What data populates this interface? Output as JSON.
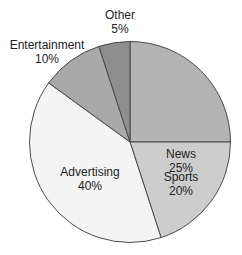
{
  "chart_data": {
    "type": "pie",
    "title": "",
    "categories": [
      "News",
      "Sports",
      "Advertising",
      "Entertainment",
      "Other"
    ],
    "values": [
      25,
      20,
      40,
      10,
      5
    ],
    "labels": [
      "News\n25%",
      "Sports\n20%",
      "Advertising\n40%",
      "Entertainment\n10%",
      "Other\n5%"
    ],
    "colors": [
      "#b4b4b4",
      "#cdcdcd",
      "#f4f4f4",
      "#a9a9a9",
      "#8e8e8e"
    ],
    "start_angle_deg": 0,
    "direction": "clockwise",
    "legend": "none"
  },
  "slices": [
    {
      "name": "News",
      "pct": "25%"
    },
    {
      "name": "Sports",
      "pct": "20%"
    },
    {
      "name": "Advertising",
      "pct": "40%"
    },
    {
      "name": "Entertainment",
      "pct": "10%"
    },
    {
      "name": "Other",
      "pct": "5%"
    }
  ]
}
